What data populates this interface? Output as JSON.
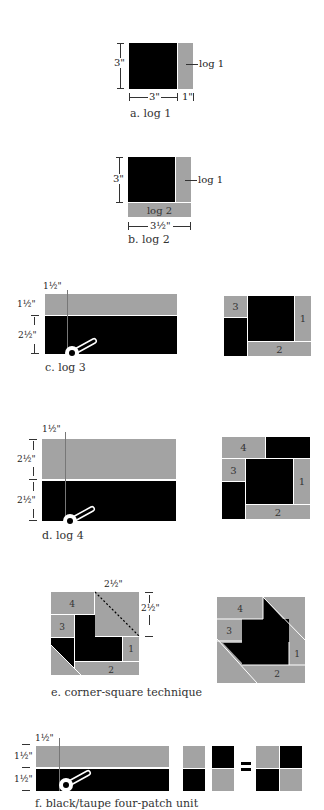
{
  "colors": {
    "black": "#000000",
    "taupe": "#a3a3a3",
    "line": "#333333",
    "background": "#ffffff"
  },
  "panel_a": {
    "caption": "a. log 1",
    "height_label": "3\"",
    "width_label": "3\"",
    "strip_width_label": "1\"",
    "log_label": "log 1"
  },
  "panel_b": {
    "caption": "b. log 2",
    "height_label": "3\"",
    "width_label": "3½\"",
    "log1_label": "log 1",
    "log2_label": "log 2"
  },
  "panel_c": {
    "caption": "c. log 3",
    "cut_label": "1½\"",
    "top_label": "1½\"",
    "bottom_label": "2½\"",
    "block_numbers": [
      "3",
      "1",
      "2"
    ]
  },
  "panel_d": {
    "caption": "d. log 4",
    "cut_label": "1½\"",
    "top_label": "2½\"",
    "bottom_label": "2½\"",
    "block_numbers": [
      "4",
      "3",
      "1",
      "2"
    ]
  },
  "panel_e": {
    "caption": "e. corner-square technique",
    "width_label": "2½\"",
    "height_label": "2½\"",
    "block_numbers": [
      "4",
      "3",
      "1",
      "2"
    ]
  },
  "panel_f": {
    "caption": "f. black/taupe four-patch unit",
    "cut_label": "1½\"",
    "top_label": "1½\"",
    "bottom_label": "1½\"",
    "equals": "="
  }
}
